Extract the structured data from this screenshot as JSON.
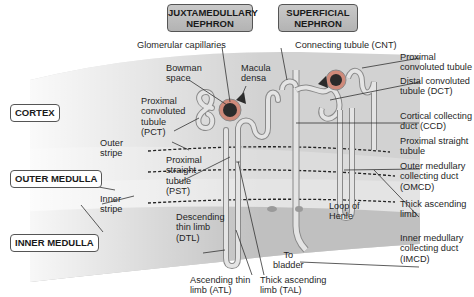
{
  "headers": {
    "juxtamedullary": [
      "JUXTAMEDULLARY",
      "NEPHRON"
    ],
    "superficial": [
      "SUPERFICIAL",
      "NEPHRON"
    ]
  },
  "zones": {
    "cortex": "CORTEX",
    "outer_medulla": "OUTER MEDULLA",
    "inner_medulla": "INNER MEDULLA"
  },
  "left_labels": {
    "glomerular_capillaries": "Glomerular capillaries",
    "bowman_space": [
      "Bowman",
      "space"
    ],
    "macula_densa": [
      "Macula",
      "densa"
    ],
    "pct": [
      "Proximal",
      "convoluted",
      "tubule",
      "(PCT)"
    ],
    "outer_stripe": [
      "Outer",
      "stripe"
    ],
    "pst": [
      "Proximal",
      "straight",
      "tubule",
      "(PST)"
    ],
    "inner_stripe": [
      "Inner",
      "stripe"
    ],
    "dtl": [
      "Descending",
      "thin limb",
      "(DTL)"
    ],
    "to_bladder": [
      "To",
      "bladder"
    ],
    "atl": [
      "Ascending thin",
      "limb (ATL)"
    ],
    "tal": [
      "Thick ascending",
      "limb (TAL)"
    ],
    "loop_of_henle": [
      "Loop of",
      "Henle"
    ]
  },
  "right_labels": {
    "cnt": "Connecting tubule (CNT)",
    "proximal_convoluted": [
      "Proximal",
      "convoluted tubule"
    ],
    "dct": [
      "Distal convoluted",
      "tubule (DCT)"
    ],
    "ccd": [
      "Cortical collecting",
      "duct (CCD)"
    ],
    "proximal_straight": [
      "Proximal straight",
      "tubule"
    ],
    "omcd": [
      "Outer medullary",
      "collecting duct",
      "(OMCD)"
    ],
    "thick_ascending": [
      "Thick ascending",
      "limb"
    ],
    "imcd": [
      "Inner medullary",
      "collecting duct",
      "(IMCD)"
    ]
  },
  "colors": {
    "cortex": "#cfcfcf",
    "outer_stripe": "#dcdcdc",
    "inner_stripe": "#e6e6e6",
    "inner_medulla": "#bdbdbd",
    "tubule_fill": "#e2e2e2",
    "tubule_stroke": "#8a8a8a",
    "glomerulus": "#2b2b2b",
    "bowman_ring": "#c46a5a",
    "header_fill": "#bdbdbd"
  }
}
